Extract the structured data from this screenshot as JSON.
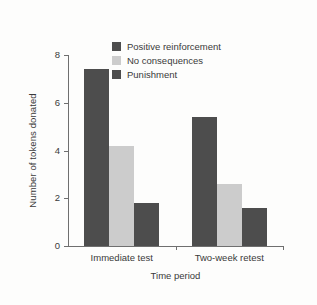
{
  "chart_data": {
    "type": "bar",
    "title": "",
    "subtitle": "",
    "xlabel": "Time period",
    "ylabel": "Number of tokens donated",
    "categories": [
      "Immediate test",
      "Two-week retest"
    ],
    "series": [
      {
        "name": "Positive reinforcement",
        "values": [
          7.4,
          5.4
        ],
        "color": "#4d4d4d"
      },
      {
        "name": "No consequences",
        "values": [
          4.2,
          2.6
        ],
        "color": "#cccccc"
      },
      {
        "name": "Punishment",
        "values": [
          1.8,
          1.6
        ],
        "color": "#4d4d4d"
      }
    ],
    "ylim": [
      0,
      8
    ],
    "yticks": [
      0,
      2,
      4,
      6,
      8
    ],
    "ytick_labels": [
      "0",
      "2",
      "4",
      "6",
      "8"
    ],
    "grid": false,
    "legend_position": "top-center",
    "axis_color": "#6f6f6f",
    "text_color": "#3a3a3a",
    "background_color": "#fdfdfc"
  }
}
